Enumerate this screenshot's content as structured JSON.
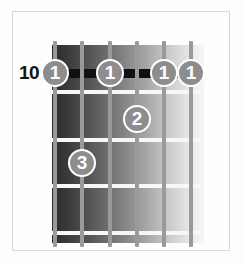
{
  "diagram": {
    "type": "guitar-chord-diagram",
    "position_label": "10",
    "strings_count": 6,
    "frets_count": 5,
    "colors": {
      "marker_fill": "#8d8d8d",
      "marker_text": "#ffffff",
      "string": "#9a9a9a",
      "fret": "#f7f7f7",
      "barre": "#101010",
      "frame": "#d8d8d6",
      "board_dark": "#2a2a2a",
      "board_light": "#f6f6f6"
    },
    "strings": [
      {
        "name": "string-1",
        "x": 55
      },
      {
        "name": "string-2",
        "x": 82
      },
      {
        "name": "string-3",
        "x": 110
      },
      {
        "name": "string-4",
        "x": 137
      },
      {
        "name": "string-5",
        "x": 164
      },
      {
        "name": "string-6",
        "x": 191
      }
    ],
    "frets": [
      {
        "name": "fret-line-1",
        "y": 90
      },
      {
        "name": "fret-line-2",
        "y": 138
      },
      {
        "name": "fret-line-3",
        "y": 184
      },
      {
        "name": "fret-line-4",
        "y": 231
      }
    ],
    "barre": {
      "y": 69,
      "label": "barre"
    },
    "markers": [
      {
        "finger": "1",
        "x": 55,
        "y": 73,
        "string": 1,
        "fret": 1
      },
      {
        "finger": "1",
        "x": 110,
        "y": 73,
        "string": 3,
        "fret": 1
      },
      {
        "finger": "1",
        "x": 164,
        "y": 73,
        "string": 5,
        "fret": 1
      },
      {
        "finger": "1",
        "x": 191,
        "y": 73,
        "string": 6,
        "fret": 1
      },
      {
        "finger": "2",
        "x": 137,
        "y": 119,
        "string": 4,
        "fret": 2
      },
      {
        "finger": "3",
        "x": 82,
        "y": 163,
        "string": 2,
        "fret": 3
      }
    ]
  }
}
